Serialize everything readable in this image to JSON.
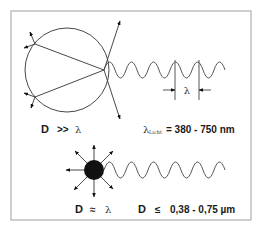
{
  "diagram": {
    "large_particle": {
      "relation_left": "D",
      "relation_op": ">>",
      "relation_right": "λ",
      "wavelength_label": "λ",
      "light_symbol": "λ",
      "light_subscript": "Licht",
      "light_range": "= 380 - 750 nm"
    },
    "small_particle": {
      "relation_left": "D",
      "relation_op": "≈",
      "relation_right": "λ",
      "size_left": "D",
      "size_op": "≤",
      "size_range": "0,38 - 0,75 µm"
    },
    "colors": {
      "line": "#333333",
      "particle_fill": "#111111",
      "frame": "#b5b5b5"
    }
  }
}
